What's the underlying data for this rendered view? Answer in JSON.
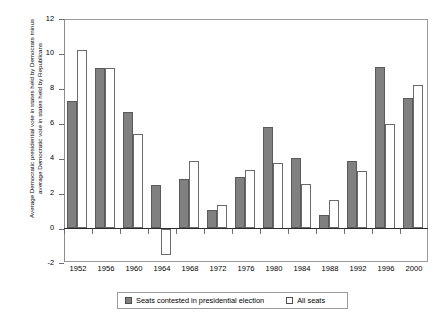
{
  "chart_data": {
    "type": "bar",
    "title": "",
    "xlabel": "",
    "ylabel": "Average Democratic presidential vote in states held by Democrats minus average Democratic vote in states held by Republicans",
    "ylim": [
      -2,
      12
    ],
    "yticks": [
      -2,
      0,
      2,
      4,
      6,
      8,
      10,
      12
    ],
    "ytick_labels": [
      "-2",
      "0",
      "2",
      "4",
      "6",
      "8",
      "10",
      "12"
    ],
    "grid": false,
    "legend_position": "bottom",
    "categories": [
      "1952",
      "1956",
      "1960",
      "1964",
      "1968",
      "1972",
      "1976",
      "1980",
      "1984",
      "1988",
      "1992",
      "1996",
      "2000"
    ],
    "series": [
      {
        "name": "Seats contested in presidential election",
        "color": "#808080",
        "values": [
          7.3,
          9.2,
          6.7,
          2.5,
          2.85,
          1.05,
          2.95,
          5.8,
          4.05,
          0.75,
          3.85,
          9.25,
          7.5
        ]
      },
      {
        "name": "All seats",
        "color": "#ffffff",
        "values": [
          10.2,
          9.2,
          5.4,
          -1.5,
          3.85,
          1.35,
          3.35,
          3.75,
          2.55,
          1.65,
          3.3,
          6.0,
          8.2
        ]
      }
    ]
  },
  "legend": {
    "items": [
      {
        "label": "Seats contested in presidential election"
      },
      {
        "label": "All seats"
      }
    ]
  }
}
